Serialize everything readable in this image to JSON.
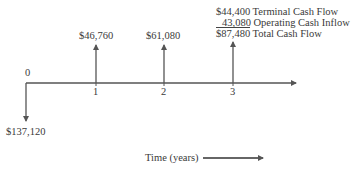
{
  "diagram": {
    "type": "cash-flow timeline",
    "axis": {
      "x_label": "Time (years)",
      "ticks": [
        "0",
        "1",
        "2",
        "3"
      ]
    },
    "cash_flows": [
      {
        "period": "0",
        "direction": "outflow",
        "label": "$137,120"
      },
      {
        "period": "1",
        "direction": "inflow",
        "label": "$46,760"
      },
      {
        "period": "2",
        "direction": "inflow",
        "label": "$61,080"
      },
      {
        "period": "3",
        "direction": "inflow",
        "label": "$87,480"
      }
    ],
    "year3_breakdown": [
      {
        "amount": "$44,400",
        "description": "Terminal Cash Flow"
      },
      {
        "amount": "43,080",
        "description": "Operating Cash Inflow"
      },
      {
        "amount": "$87,480",
        "description": "Total Cash Flow"
      }
    ]
  },
  "colors": {
    "ink": "#3a3a3a",
    "background": "#ffffff"
  }
}
